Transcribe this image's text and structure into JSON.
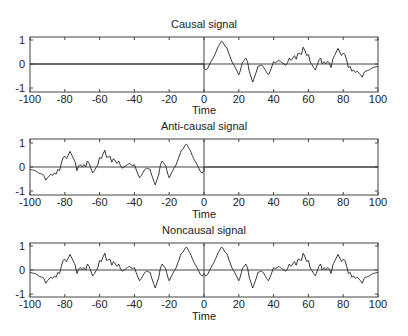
{
  "figure": {
    "colors": {
      "line": "#333333",
      "axes": "#444444",
      "background": "#ffffff"
    }
  },
  "chart_data": [
    {
      "type": "line",
      "title": "Causal signal",
      "xlabel": "Time",
      "ylabel": "",
      "xlim": [
        -100,
        100
      ],
      "ylim": [
        -1.2,
        1.2
      ],
      "xticks": [
        "-100",
        "-80",
        "-60",
        "-40",
        "-20",
        "0",
        "20",
        "40",
        "60",
        "80",
        "100"
      ],
      "yticks": [
        "1",
        "0",
        "-1"
      ],
      "grid": false,
      "reference_lines": {
        "horizontal": 0,
        "vertical": 0
      },
      "series": [
        {
          "name": "causal",
          "x": [
            -100,
            0,
            0,
            1,
            2,
            4,
            6,
            8,
            10,
            11,
            12,
            13,
            14,
            16,
            18,
            20,
            21,
            22,
            24,
            25,
            26,
            28,
            30,
            31,
            33,
            34,
            36,
            37,
            38,
            40,
            41,
            43,
            45,
            47,
            48,
            49,
            50,
            52,
            53,
            54,
            56,
            57,
            58,
            59,
            60,
            61,
            63,
            64,
            66,
            67,
            68,
            69,
            70,
            71,
            72,
            73,
            74,
            76,
            77,
            78,
            79,
            80,
            81,
            82,
            83,
            84,
            85,
            86,
            87,
            88,
            90,
            91,
            92,
            93,
            95,
            97,
            100
          ],
          "values": [
            0,
            0,
            -0.15,
            -0.25,
            -0.2,
            0.1,
            0.35,
            0.7,
            0.95,
            0.9,
            0.75,
            0.7,
            0.5,
            0.1,
            -0.15,
            -0.45,
            -0.25,
            0.05,
            0.25,
            0.1,
            -0.3,
            -0.75,
            -0.35,
            -0.1,
            -0.05,
            -0.1,
            -0.35,
            -0.45,
            -0.3,
            0.1,
            0.05,
            0.15,
            0.05,
            -0.05,
            0.05,
            0.25,
            0.15,
            0.35,
            0.2,
            0.45,
            0.4,
            0.7,
            0.55,
            0.35,
            0.4,
            0.1,
            -0.15,
            -0.25,
            0.15,
            0.25,
            0.0,
            0.1,
            0.0,
            0.1,
            0.05,
            -0.15,
            0.2,
            0.5,
            0.65,
            0.5,
            0.35,
            0.45,
            0.4,
            0.15,
            -0.15,
            -0.1,
            -0.3,
            -0.25,
            -0.35,
            -0.3,
            -0.45,
            -0.55,
            -0.35,
            -0.3,
            -0.25,
            -0.15,
            -0.1
          ]
        }
      ]
    },
    {
      "type": "line",
      "title": "Anti-causal signal",
      "xlabel": "Time",
      "ylabel": "",
      "xlim": [
        -100,
        100
      ],
      "ylim": [
        -1.2,
        1.2
      ],
      "xticks": [
        "-100",
        "-80",
        "-60",
        "-40",
        "-20",
        "0",
        "20",
        "40",
        "60",
        "80",
        "100"
      ],
      "yticks": [
        "1",
        "0",
        "-1"
      ],
      "grid": false,
      "reference_lines": {
        "horizontal": 0,
        "vertical": 0
      },
      "note": "time-reversed copy of the causal signal (x -> -x), zero for t > 0",
      "series": [
        {
          "name": "anti-causal",
          "derived_from": "causal",
          "transform": "mirror"
        }
      ]
    },
    {
      "type": "line",
      "title": "Noncausal signal",
      "xlabel": "Time",
      "ylabel": "",
      "xlim": [
        -100,
        100
      ],
      "ylim": [
        -1.2,
        1.2
      ],
      "xticks": [
        "-100",
        "-80",
        "-60",
        "-40",
        "-20",
        "0",
        "20",
        "40",
        "60",
        "80",
        "100"
      ],
      "yticks": [
        "1",
        "0",
        "-1"
      ],
      "grid": false,
      "reference_lines": {
        "horizontal": 0,
        "vertical": 0
      },
      "note": "sum of causal and anti-causal signals",
      "series": [
        {
          "name": "noncausal",
          "derived_from": "causal",
          "transform": "sum-with-mirror"
        }
      ]
    }
  ],
  "panels": [
    {
      "title": "Causal signal",
      "xlabel": "Time"
    },
    {
      "title": "Anti-causal signal",
      "xlabel": "Time"
    },
    {
      "title": "Noncausal signal",
      "xlabel": "Time"
    }
  ]
}
